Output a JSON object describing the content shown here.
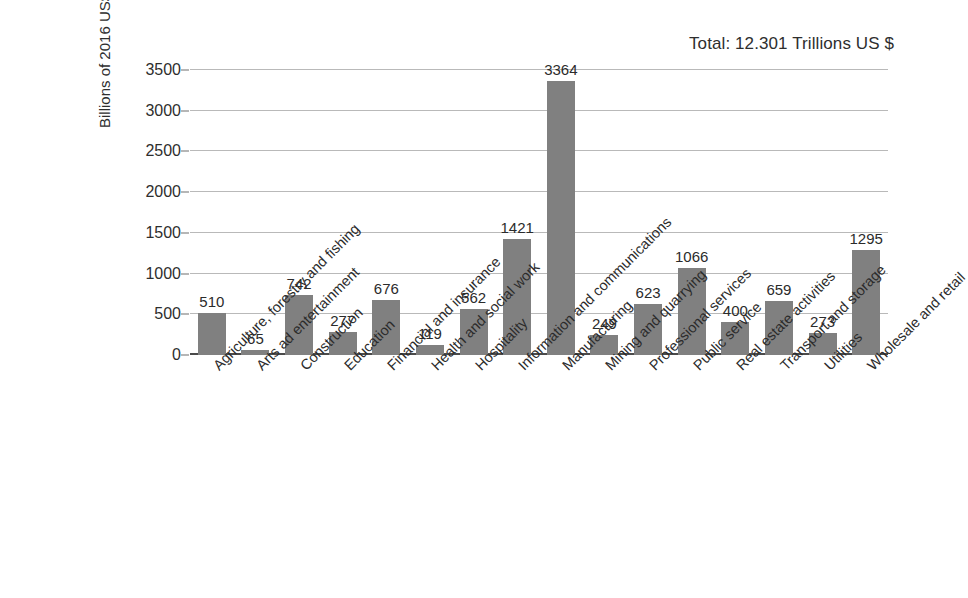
{
  "chart_data": {
    "type": "bar",
    "title": "",
    "annotation": "Total: 12.301 Trillions US $",
    "xlabel": "",
    "ylabel": "Billions of 2016 US$",
    "ylim": [
      0,
      3500
    ],
    "ytick_values": [
      0,
      500,
      1000,
      1500,
      2000,
      2500,
      3000,
      3500
    ],
    "ytick_labels": [
      "0",
      "500",
      "1000",
      "1500",
      "2000",
      "2500",
      "3000",
      "3500"
    ],
    "grid": true,
    "legend": false,
    "bar_color": "#808080",
    "categories": [
      "Agriculture, forestry and fishing",
      "Arts ad entertainment",
      "Construction",
      "Education",
      "Financial and insurance",
      "Health and social work",
      "Hospitality",
      "Information and communications",
      "Manufacturing",
      "Mining and quarrying",
      "Professional services",
      "Public service",
      "Real estate activities",
      "Transport and storage",
      "Utilities",
      "Wholesale and retail"
    ],
    "values": [
      510,
      65,
      742,
      277,
      676,
      119,
      562,
      1421,
      3364,
      249,
      623,
      1066,
      400,
      659,
      273,
      1295
    ],
    "value_labels": [
      "510",
      "65",
      "742",
      "277",
      "676",
      "119",
      "562",
      "1421",
      "3364",
      "249",
      "623",
      "1066",
      "400",
      "659",
      "273",
      "1295"
    ]
  }
}
